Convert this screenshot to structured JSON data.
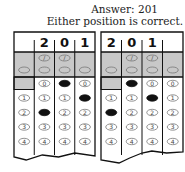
{
  "caption": {
    "answer_line": "Answer: 201",
    "note_line": "Either position is correct."
  },
  "grids": [
    {
      "name": "left-grid",
      "entries": [
        "",
        "2",
        "0",
        "1"
      ],
      "filled": [
        null,
        "2",
        "0",
        "1"
      ]
    },
    {
      "name": "right-grid",
      "entries": [
        "2",
        "0",
        "1",
        ""
      ],
      "filled": [
        "2",
        "0",
        "1",
        null
      ]
    }
  ],
  "bubble_rows": {
    "slash_row": [
      "",
      "/",
      "/",
      ""
    ],
    "decimal_row": [
      ".",
      ".",
      ".",
      "."
    ],
    "digits": [
      "0",
      "1",
      "2",
      "3",
      "4"
    ]
  },
  "colors": {
    "shade": "#c8c8c8",
    "ink": "#111111",
    "bubble_stroke": "#777777"
  }
}
